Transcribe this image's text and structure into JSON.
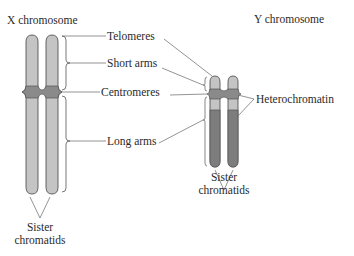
{
  "titles": {
    "x_chromosome": "X chromosome",
    "y_chromosome": "Y chromosome"
  },
  "labels": {
    "telomeres": "Telomeres",
    "short_arms": "Short arms",
    "centromeres": "Centromeres",
    "long_arms": "Long arms",
    "heterochromatin": "Heterochromatin"
  },
  "x_sister": {
    "line1": "Sister",
    "line2": "chromatids"
  },
  "y_sister": {
    "line1": "Sister",
    "line2": "chromatids"
  },
  "colors": {
    "chromatid_light": "#c4c4c4",
    "centromere_dark": "#8a8a8a",
    "heterochromatin_dark": "#7d7d7d",
    "outline": "#555555",
    "leader_line": "#666666"
  }
}
